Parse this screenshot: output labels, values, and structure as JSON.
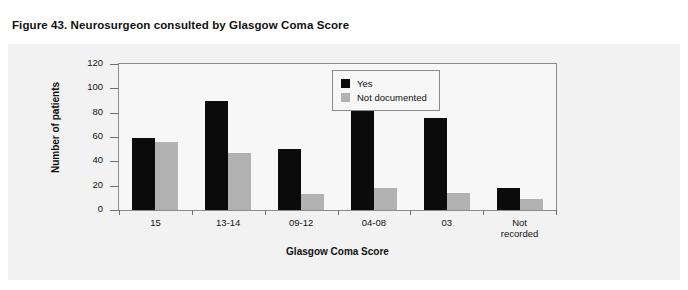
{
  "figure": {
    "title": "Figure 43. Neurosurgeon consulted by Glasgow Coma Score"
  },
  "colors": {
    "yes": "#0b0b0b",
    "not_documented": "#b2b2b2",
    "axis": "#8b8b8b",
    "panel_background": "#f2f2f2",
    "plot_background": "#f7f7f7",
    "text": "#111111"
  },
  "chart_data": {
    "type": "bar",
    "title": "Figure 43. Neurosurgeon consulted by Glasgow Coma Score",
    "xlabel": "Glasgow Coma Score",
    "ylabel": "Number of patients",
    "categories": [
      "15",
      "13-14",
      "09-12",
      "04-08",
      "03",
      "Not recorded"
    ],
    "category_lines": [
      [
        "15"
      ],
      [
        "13-14"
      ],
      [
        "09-12"
      ],
      [
        "04-08"
      ],
      [
        "03"
      ],
      [
        "Not",
        "recorded"
      ]
    ],
    "series": [
      {
        "name": "Yes",
        "color": "#0b0b0b",
        "values": [
          59,
          90,
          50,
          102,
          76,
          18
        ]
      },
      {
        "name": "Not documented",
        "color": "#b2b2b2",
        "values": [
          56,
          47,
          13,
          18,
          14,
          9
        ]
      }
    ],
    "ylim": [
      0,
      120
    ],
    "yticks": [
      0,
      20,
      40,
      60,
      80,
      100,
      120
    ],
    "ytick_labels": [
      "0",
      "20",
      "40",
      "60",
      "80",
      "100",
      "120"
    ],
    "grid": false,
    "legend_position": "top-right"
  },
  "legend": {
    "entries": [
      {
        "label": "Yes"
      },
      {
        "label": "Not documented"
      }
    ]
  }
}
